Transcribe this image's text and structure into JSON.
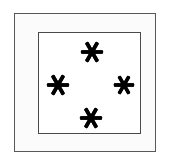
{
  "figure": {
    "canvas": {
      "width": 169,
      "height": 162,
      "background_color": "#ffffff"
    },
    "outer_frame": {
      "label": "outer-frame",
      "x": 14,
      "y": 13,
      "width": 142,
      "height": 139,
      "border_color": "#585858",
      "border_width": 1.5,
      "mat_fill_color": "#fbfbfb"
    },
    "inner_square": {
      "label": "inner-square",
      "x": 38,
      "y": 32,
      "width": 103,
      "height": 102,
      "border_color": "#4a4a4a",
      "border_width": 1.5,
      "fill_color": "#ffffff"
    },
    "marks": {
      "glyph": "asterisk",
      "count": 4,
      "color": "#000000",
      "arms": 6,
      "arrangement": "diamond",
      "items": [
        {
          "name": "asterisk-top",
          "position": "top",
          "cx": 92,
          "cy": 52,
          "size": 24
        },
        {
          "name": "asterisk-left",
          "position": "left",
          "cx": 58,
          "cy": 85,
          "size": 24
        },
        {
          "name": "asterisk-right",
          "position": "right",
          "cx": 124,
          "cy": 85,
          "size": 22
        },
        {
          "name": "asterisk-bottom",
          "position": "bottom",
          "cx": 91,
          "cy": 118,
          "size": 24
        }
      ]
    }
  }
}
